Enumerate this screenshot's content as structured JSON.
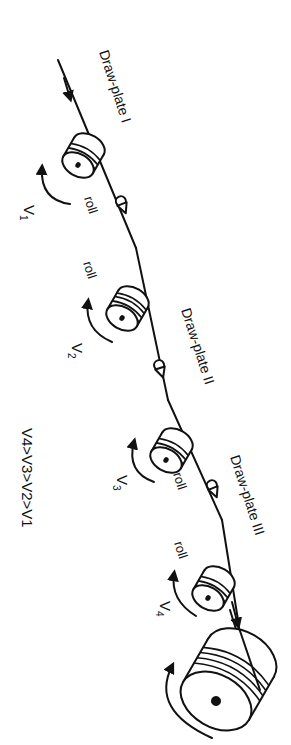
{
  "diagram": {
    "type": "wire drawing process schematic",
    "labels": {
      "plate1": "Draw-plate I",
      "plate2": "Draw-plate II",
      "plate3": "Draw-plate III",
      "roll": "roll",
      "v1": "V",
      "v1_sub": "1",
      "v2": "V",
      "v2_sub": "2",
      "v3": "V",
      "v3_sub": "3",
      "v4": "V",
      "v4_sub": "4",
      "relation": "V4>V3>V2>V1"
    },
    "components": [
      {
        "kind": "roll",
        "name": "roll-1",
        "speed": "V1"
      },
      {
        "kind": "draw-plate",
        "name": "draw-plate-1"
      },
      {
        "kind": "roll",
        "name": "roll-2",
        "speed": "V2"
      },
      {
        "kind": "draw-plate",
        "name": "draw-plate-2"
      },
      {
        "kind": "roll",
        "name": "roll-3",
        "speed": "V3"
      },
      {
        "kind": "draw-plate",
        "name": "draw-plate-3"
      },
      {
        "kind": "roll",
        "name": "roll-4",
        "speed": "V4"
      },
      {
        "kind": "take-up drum",
        "name": "take-up-drum"
      }
    ],
    "colors": {
      "ink": "#111111",
      "background": "#ffffff"
    }
  }
}
